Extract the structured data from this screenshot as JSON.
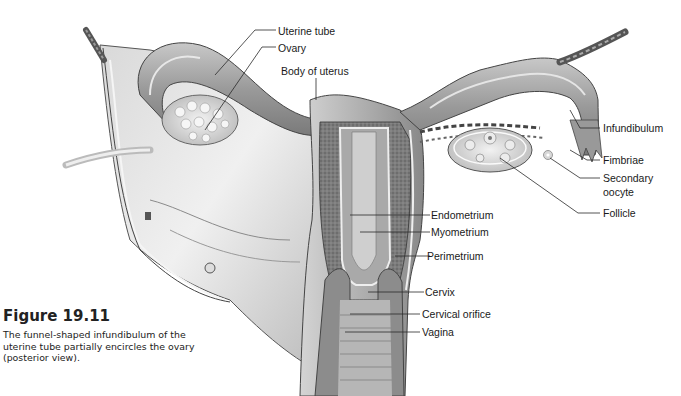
{
  "figure": {
    "number": "Figure 19.11",
    "caption": "The funnel-shaped infundibulum of the uterine tube partially encircles the ovary (posterior view).",
    "view": "posterior view"
  },
  "labels": {
    "uterine_tube": "Uterine tube",
    "ovary": "Ovary",
    "body_of_uterus": "Body of uterus",
    "infundibulum": "Infundibulum",
    "fimbriae": "Fimbriae",
    "secondary_oocyte_line1": "Secondary",
    "secondary_oocyte_line2": "oocyte",
    "follicle": "Follicle",
    "endometrium": "Endometrium",
    "myometrium": "Myometrium",
    "perimetrium": "Perimetrium",
    "cervix": "Cervix",
    "cervical_orifice": "Cervical orifice",
    "vagina": "Vagina"
  },
  "colors": {
    "background": "#ffffff",
    "tissue_light": "#e2e2e2",
    "tissue_mid": "#b4b4b4",
    "tissue_dark": "#6e6e6e",
    "leader_line": "#2a2a2a",
    "text": "#1a1a1a"
  }
}
